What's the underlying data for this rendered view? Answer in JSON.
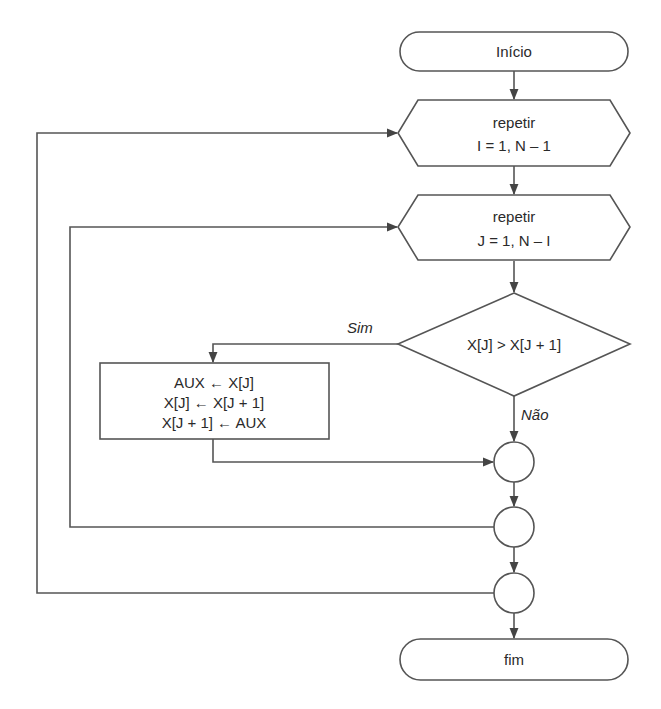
{
  "diagram": {
    "type": "flowchart",
    "nodes": {
      "start": {
        "kind": "terminal",
        "label": "Início"
      },
      "loop_i": {
        "kind": "loop-hexagon",
        "line1": "repetir",
        "line2": "I = 1, N – 1"
      },
      "loop_j": {
        "kind": "loop-hexagon",
        "line1": "repetir",
        "line2": "J = 1, N – I"
      },
      "decision": {
        "kind": "decision",
        "label": "X[J] > X[J + 1]"
      },
      "swap": {
        "kind": "process",
        "lines": [
          "AUX ← X[J]",
          "X[J] ← X[J + 1]",
          "X[J + 1] ← AUX"
        ]
      },
      "join_if": {
        "kind": "connector",
        "label": ""
      },
      "end_loop_j": {
        "kind": "connector",
        "label": ""
      },
      "end_loop_i": {
        "kind": "connector",
        "label": ""
      },
      "end": {
        "kind": "terminal",
        "label": "fim"
      }
    },
    "edge_labels": {
      "yes": "Sim",
      "no": "Não"
    },
    "edges": [
      {
        "from": "start",
        "to": "loop_i"
      },
      {
        "from": "loop_i",
        "to": "loop_j"
      },
      {
        "from": "loop_j",
        "to": "decision"
      },
      {
        "from": "decision",
        "to": "swap",
        "label": "Sim"
      },
      {
        "from": "decision",
        "to": "join_if",
        "label": "Não"
      },
      {
        "from": "swap",
        "to": "join_if"
      },
      {
        "from": "join_if",
        "to": "end_loop_j"
      },
      {
        "from": "end_loop_j",
        "to": "loop_j",
        "kind": "loop-back"
      },
      {
        "from": "end_loop_j",
        "to": "end_loop_i"
      },
      {
        "from": "end_loop_i",
        "to": "loop_i",
        "kind": "loop-back"
      },
      {
        "from": "end_loop_i",
        "to": "end"
      }
    ]
  }
}
